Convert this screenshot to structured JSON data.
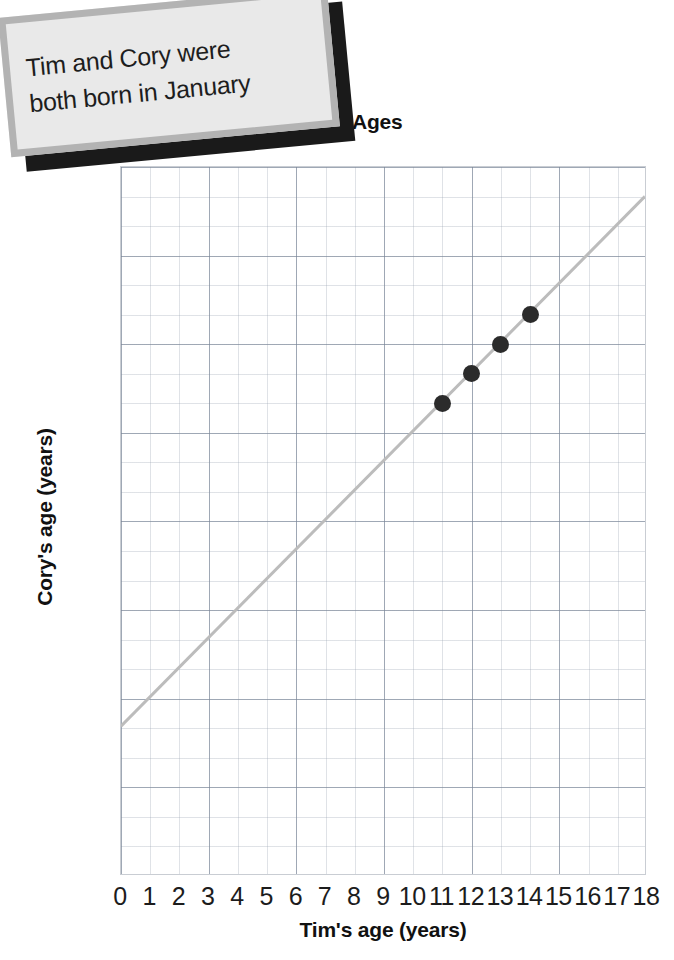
{
  "callout": {
    "name": "speech-callout",
    "lines": [
      "Tim and Cory were",
      "both born in January"
    ],
    "fill_color": "#e9e9e9",
    "border_color": "#b3b3b3",
    "shadow_color": "#1a1a1a"
  },
  "chart_data": {
    "type": "scatter",
    "title": "Ages",
    "xlabel": "Tim's age (years)",
    "ylabel": "Cory's age (years)",
    "xlim": [
      0,
      18
    ],
    "ylim": [
      0,
      24
    ],
    "xticks": [
      0,
      1,
      2,
      3,
      4,
      5,
      6,
      7,
      8,
      9,
      10,
      11,
      12,
      13,
      14,
      15,
      16,
      17,
      18
    ],
    "yticks": [
      1,
      2,
      3,
      4,
      5,
      6,
      7,
      8,
      9,
      10,
      11,
      12,
      13,
      14,
      15,
      16,
      17,
      18,
      19,
      20,
      21,
      22,
      23
    ],
    "grid": true,
    "legend": "none",
    "point_color": "#2b2b2b",
    "line_color": "#bcbcbc",
    "grid_color": "#c0c6cf",
    "points": [
      {
        "x": 11,
        "y": 16
      },
      {
        "x": 12,
        "y": 17
      },
      {
        "x": 13,
        "y": 18
      },
      {
        "x": 14,
        "y": 19
      }
    ],
    "trend_line": {
      "x0": 0,
      "y0": 5,
      "x1": 18,
      "y1": 23,
      "description": "Cory is 5 years older than Tim"
    }
  }
}
